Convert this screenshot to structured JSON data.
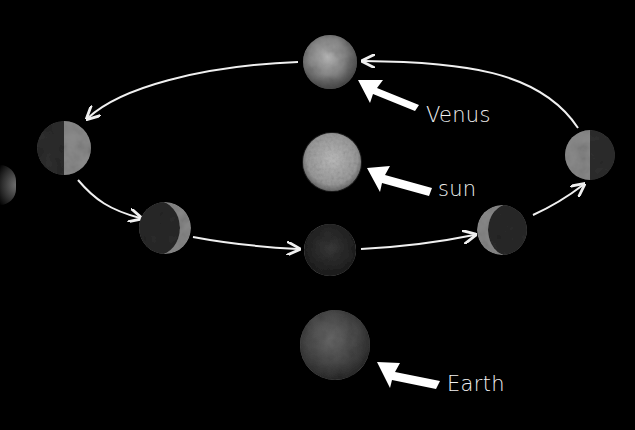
{
  "diagram": {
    "labels": {
      "venus": "Venus",
      "sun": "sun",
      "earth": "Earth"
    },
    "colors": {
      "background": "#000000",
      "orbit_line": "#f0f0f0",
      "label_text": "#f2f2f2",
      "pointer_arrow": "#ffffff"
    },
    "bodies": [
      {
        "name": "venus-full",
        "cx": 330,
        "cy": 62,
        "r": 27,
        "phase": "full"
      },
      {
        "name": "sun",
        "cx": 332,
        "cy": 162,
        "r": 29,
        "phase": "sun"
      },
      {
        "name": "venus-half-left",
        "cx": 64,
        "cy": 148,
        "r": 27,
        "phase": "half-lit-right"
      },
      {
        "name": "venus-crescent-left",
        "cx": 165,
        "cy": 228,
        "r": 26,
        "phase": "crescent-right"
      },
      {
        "name": "venus-new",
        "cx": 330,
        "cy": 250,
        "r": 26,
        "phase": "new"
      },
      {
        "name": "venus-crescent-right",
        "cx": 502,
        "cy": 230,
        "r": 25,
        "phase": "crescent-left"
      },
      {
        "name": "venus-half-right",
        "cx": 590,
        "cy": 155,
        "r": 25,
        "phase": "half-lit-left"
      },
      {
        "name": "earth",
        "cx": 335,
        "cy": 345,
        "r": 35,
        "phase": "earth"
      }
    ],
    "orbit_direction": "counter-clockwise (as viewed)"
  }
}
